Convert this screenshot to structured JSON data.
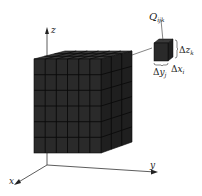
{
  "figure": {
    "colors": {
      "front_face": "#2a2a2a",
      "top_face": "#3a3a3a",
      "side_face": "#1f1f1f",
      "grid_line": "#0a0a0a",
      "axis": "#333333",
      "background": "#ffffff"
    },
    "grid": {
      "front_columns": 6,
      "front_rows": 6,
      "depth_cells": 3
    }
  },
  "axes": {
    "z_label": "z",
    "y_label": "y",
    "x_label": "x"
  },
  "cell": {
    "label_main": "Q",
    "label_sub": "ijk",
    "dz_delta": "Δ",
    "dz_var": "z",
    "dz_sub": "k",
    "dy_delta": "Δ",
    "dy_var": "y",
    "dy_sub": "j",
    "dx_delta": "Δ",
    "dx_var": "x",
    "dx_sub": "i"
  }
}
